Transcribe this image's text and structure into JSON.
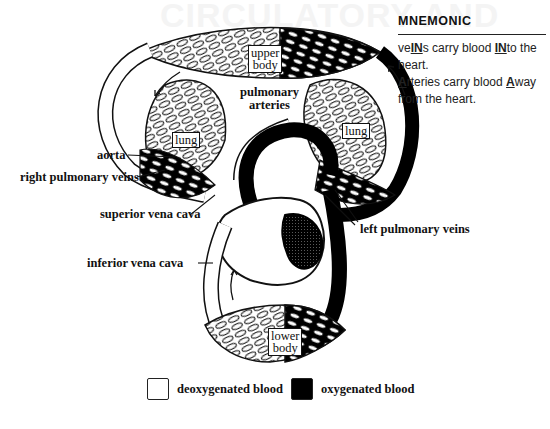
{
  "background_ghost_text": "CIRCULATORY AND",
  "mnemonic": {
    "title": "MNEMONIC",
    "line1": {
      "pre": "ve",
      "u1": "IN",
      "mid": "s carry blood ",
      "u2": "IN",
      "post": "to the heart."
    },
    "line2": {
      "u1": "A",
      "mid": "rteries carry blood ",
      "u2": "A",
      "post": "way from the heart."
    }
  },
  "diagram": {
    "box_labels": {
      "upper_body": [
        "upper",
        "body"
      ],
      "lung_left": "lung",
      "lung_right": "lung",
      "lower_body": [
        "lower",
        "body"
      ]
    },
    "labels": {
      "pulmonary_arteries": [
        "pulmonary",
        "arteries"
      ],
      "aorta": "aorta",
      "right_pulmonary_veins": "right pulmonary veins",
      "superior_vena_cava": "superior vena cava",
      "left_pulmonary_veins": "left pulmonary veins",
      "inferior_vena_cava": "inferior vena cava"
    },
    "colors": {
      "deoxygenated": "#ffffff",
      "oxygenated": "#000000",
      "outline": "#111111"
    }
  },
  "legend": [
    {
      "label": "deoxygenated blood",
      "swatch": "white"
    },
    {
      "label": "oxygenated blood",
      "swatch": "black"
    }
  ]
}
